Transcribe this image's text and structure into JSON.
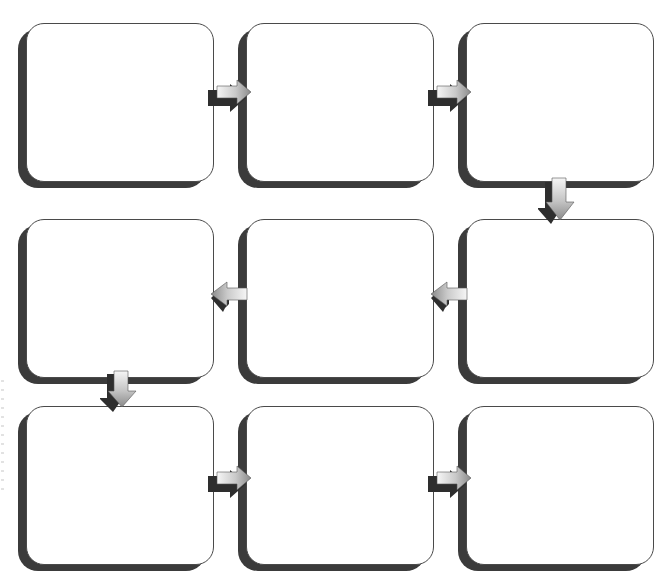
{
  "diagram": {
    "type": "flowchart",
    "colors": {
      "box_fill": "#ffffff",
      "box_border": "#4a4a4a",
      "box_shadow": "#3b3b3b",
      "arrow_light": "#f4f4f4",
      "arrow_mid": "#9a9a9a",
      "arrow_dark": "#2e2e2e"
    },
    "boxes": [
      {
        "id": "step-1",
        "row": 1,
        "col": 1,
        "label": ""
      },
      {
        "id": "step-2",
        "row": 1,
        "col": 2,
        "label": ""
      },
      {
        "id": "step-3",
        "row": 1,
        "col": 3,
        "label": ""
      },
      {
        "id": "step-4",
        "row": 2,
        "col": 3,
        "label": ""
      },
      {
        "id": "step-5",
        "row": 2,
        "col": 2,
        "label": ""
      },
      {
        "id": "step-6",
        "row": 2,
        "col": 1,
        "label": ""
      },
      {
        "id": "step-7",
        "row": 3,
        "col": 1,
        "label": ""
      },
      {
        "id": "step-8",
        "row": 3,
        "col": 2,
        "label": ""
      },
      {
        "id": "step-9",
        "row": 3,
        "col": 3,
        "label": ""
      }
    ],
    "arrows": [
      {
        "from": "step-1",
        "to": "step-2",
        "direction": "right",
        "icon": "arrow-right-icon"
      },
      {
        "from": "step-2",
        "to": "step-3",
        "direction": "right",
        "icon": "arrow-right-icon"
      },
      {
        "from": "step-3",
        "to": "step-4",
        "direction": "down",
        "icon": "arrow-down-icon"
      },
      {
        "from": "step-4",
        "to": "step-5",
        "direction": "left",
        "icon": "arrow-left-icon"
      },
      {
        "from": "step-5",
        "to": "step-6",
        "direction": "left",
        "icon": "arrow-left-icon"
      },
      {
        "from": "step-6",
        "to": "step-7",
        "direction": "down",
        "icon": "arrow-down-icon"
      },
      {
        "from": "step-7",
        "to": "step-8",
        "direction": "right",
        "icon": "arrow-right-icon"
      },
      {
        "from": "step-8",
        "to": "step-9",
        "direction": "right",
        "icon": "arrow-right-icon"
      }
    ]
  }
}
